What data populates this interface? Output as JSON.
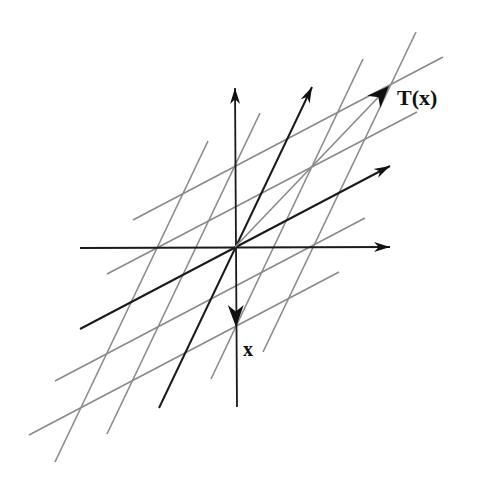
{
  "diagram": {
    "colors": {
      "background": "#ffffff",
      "axis": "#1a1a1a",
      "image_basis": "#1a1a1a",
      "grid": "#8a8a8a",
      "arrowhead": "#111111"
    },
    "origin": [
      235,
      247
    ],
    "axes": {
      "horizontal": {
        "from": [
          80,
          248
        ],
        "to": [
          390,
          247
        ]
      },
      "vertical": {
        "from": [
          237,
          407
        ],
        "to": [
          235,
          88
        ]
      }
    },
    "image_basis_vectors": [
      {
        "name": "T(e1)",
        "from": [
          80,
          329
        ],
        "to": [
          390,
          166
        ]
      },
      {
        "name": "T(e2)",
        "from": [
          159,
          408
        ],
        "to": [
          312,
          87
        ]
      }
    ],
    "grid_lines_shallow": [
      {
        "from": [
          133,
          220
        ],
        "to": [
          443,
          57
        ]
      },
      {
        "from": [
          107,
          274
        ],
        "to": [
          417,
          112
        ]
      },
      {
        "from": [
          55,
          381
        ],
        "to": [
          365,
          218
        ]
      },
      {
        "from": [
          29,
          435
        ],
        "to": [
          339,
          272
        ]
      }
    ],
    "grid_lines_steep": [
      {
        "from": [
          55,
          462
        ],
        "to": [
          208,
          141
        ]
      },
      {
        "from": [
          107,
          434
        ],
        "to": [
          260,
          113
        ]
      },
      {
        "from": [
          211,
          379
        ],
        "to": [
          363,
          59
        ]
      },
      {
        "from": [
          263,
          352
        ],
        "to": [
          416,
          32
        ]
      }
    ],
    "vectors": {
      "x": {
        "label": "x",
        "from": [
          235,
          247
        ],
        "to": [
          236,
          327
        ],
        "label_pos": [
          243,
          356
        ]
      },
      "Tx": {
        "label": "T(x)",
        "from": [
          235,
          247
        ],
        "to": [
          389,
          86
        ],
        "label_pos": [
          397,
          105
        ]
      }
    }
  }
}
